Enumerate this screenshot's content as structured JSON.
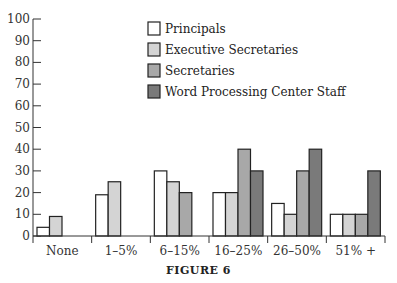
{
  "chart_data": {
    "type": "bar",
    "title": "",
    "caption": "FIGURE 6",
    "xlabel": "",
    "ylabel": "",
    "ylim": [
      0,
      100
    ],
    "yticks": [
      0,
      10,
      20,
      30,
      40,
      50,
      60,
      70,
      80,
      90,
      100
    ],
    "grid": false,
    "legend_position": "top-right",
    "categories": [
      "None",
      "1–5%",
      "6–15%",
      "16–25%",
      "26–50%",
      "51% +"
    ],
    "series": [
      {
        "name": "Principals",
        "color": "#ffffff",
        "values": [
          4,
          19,
          30,
          20,
          15,
          10
        ]
      },
      {
        "name": "Executive Secretaries",
        "color": "#d4d4d4",
        "values": [
          9,
          25,
          25,
          20,
          10,
          10
        ]
      },
      {
        "name": "Secretaries",
        "color": "#a8a8a8",
        "values": [
          null,
          null,
          20,
          40,
          30,
          10
        ]
      },
      {
        "name": "Word Processing Center Staff",
        "color": "#7a7a7a",
        "values": [
          null,
          null,
          null,
          30,
          40,
          30
        ]
      }
    ]
  },
  "figure": {
    "caption": "FIGURE 6"
  }
}
